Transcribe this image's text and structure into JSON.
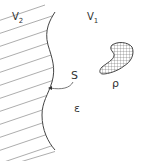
{
  "diagram": {
    "type": "region-boundary-sketch",
    "labels": {
      "v2": "V",
      "v2_sub": "2",
      "v1": "V",
      "v1_sub": "1",
      "surface": "S",
      "charge_density": "ρ",
      "permittivity": "ε"
    },
    "colors": {
      "line": "#444444",
      "hatch": "#8a8a8a",
      "text": "#333333",
      "background": "#ffffff"
    }
  }
}
